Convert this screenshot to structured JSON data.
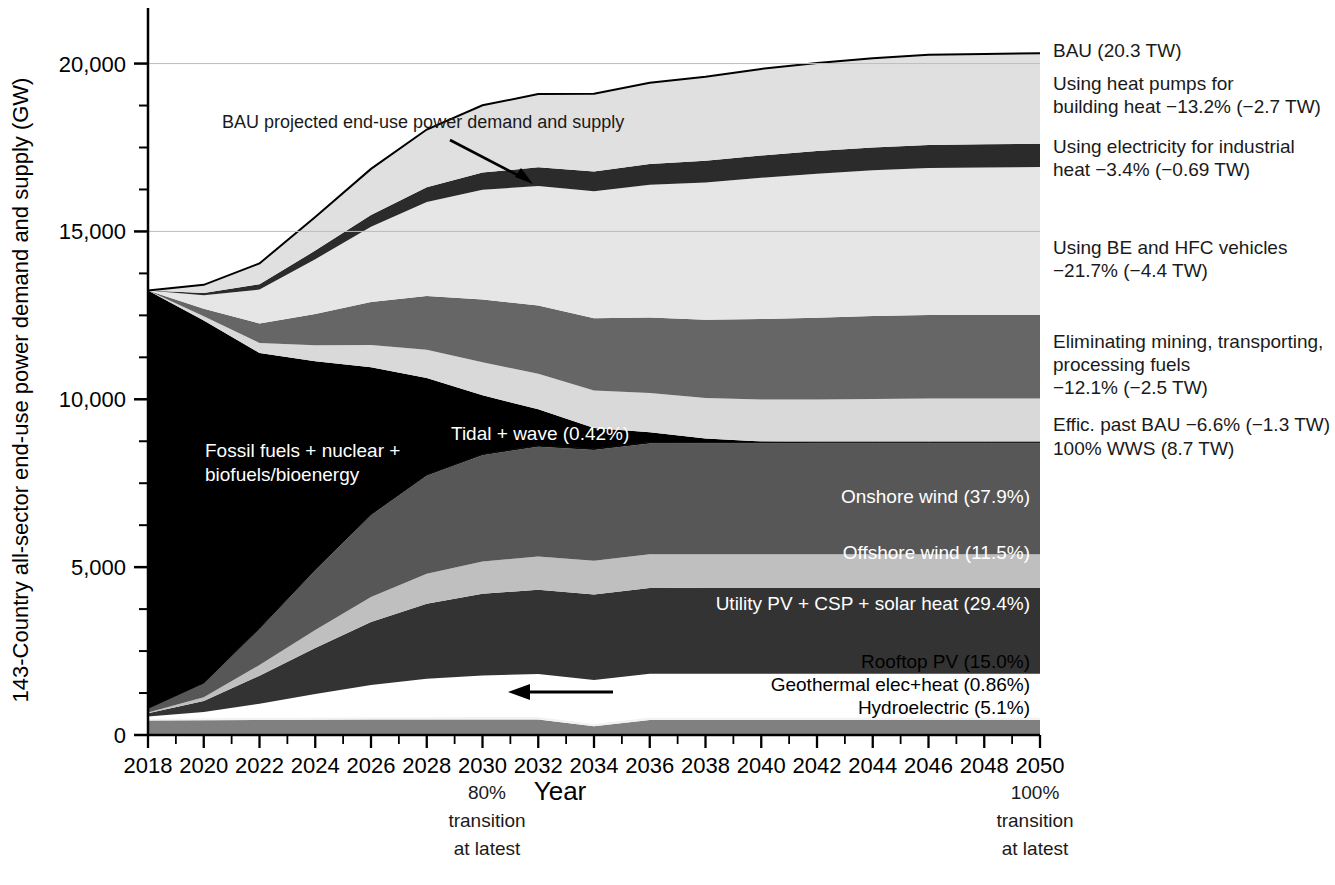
{
  "chart_data": {
    "type": "area",
    "title": "",
    "xlabel": "Year",
    "ylabel": "143-Country all-sector end-use power demand and supply (GW)",
    "xlim": [
      2018,
      2050
    ],
    "ylim": [
      0,
      21000
    ],
    "ytick_values": [
      0,
      5000,
      10000,
      15000,
      20000
    ],
    "ytick_labels": [
      "0",
      "5,000",
      "10,000",
      "15,000",
      "20,000"
    ],
    "xtick_labels": [
      "2018",
      "2020",
      "2022",
      "2024",
      "2026",
      "2028",
      "2030",
      "2032",
      "2034",
      "2036",
      "2038",
      "2040",
      "2042",
      "2044",
      "2046",
      "2048",
      "2050"
    ],
    "grid": "horizontal-faint",
    "legend": "inline-labels",
    "x": [
      2018,
      2020,
      2022,
      2024,
      2026,
      2028,
      2030,
      2032,
      2034,
      2036,
      2038,
      2040,
      2042,
      2044,
      2046,
      2048,
      2050
    ],
    "series": [
      {
        "name": "Hydroelectric",
        "label": "Hydroelectric (5.1%)",
        "color": "#808080",
        "values": [
          430,
          440,
          450,
          455,
          460,
          462,
          463,
          464,
          264,
          444,
          444,
          444,
          444,
          444,
          444,
          444,
          444
        ]
      },
      {
        "name": "Geothermal elec+heat",
        "label": "Geothermal elec+heat (0.86%)",
        "color": "#f2f2f2",
        "values": [
          60,
          62,
          64,
          66,
          68,
          70,
          72,
          73,
          74,
          74,
          75,
          75,
          75,
          75,
          75,
          75,
          75
        ]
      },
      {
        "name": "Rooftop PV",
        "label": "Rooftop PV (15.0%)",
        "color": "#ffffff",
        "values": [
          60,
          180,
          420,
          700,
          960,
          1140,
          1240,
          1280,
          1300,
          1305,
          1305,
          1305,
          1305,
          1305,
          1305,
          1305,
          1305
        ]
      },
      {
        "name": "Utility PV + CSP + solar heat",
        "label": "Utility PV + CSP + solar heat (29.4%)",
        "color": "#333333",
        "values": [
          100,
          330,
          830,
          1370,
          1880,
          2240,
          2430,
          2510,
          2550,
          2558,
          2560,
          2560,
          2560,
          2560,
          2560,
          2560,
          2560
        ]
      },
      {
        "name": "Offshore wind",
        "label": "Offshore wind (11.5%)",
        "color": "#bfbfbf",
        "values": [
          20,
          110,
          320,
          540,
          740,
          890,
          960,
          990,
          1000,
          1001,
          1001,
          1001,
          1001,
          1001,
          1001,
          1001,
          1001
        ]
      },
      {
        "name": "Onshore wind",
        "label": "Onshore wind (37.9%)",
        "color": "#575757",
        "values": [
          120,
          420,
          1080,
          1780,
          2440,
          2920,
          3170,
          3270,
          3300,
          3299,
          3299,
          3299,
          3299,
          3299,
          3299,
          3299,
          3299
        ]
      },
      {
        "name": "Tidal + wave",
        "label": "Tidal + wave (0.42%)",
        "color": "#111111",
        "values": [
          3,
          8,
          14,
          22,
          28,
          33,
          35,
          36,
          37,
          37,
          37,
          37,
          37,
          37,
          37,
          37,
          37
        ]
      },
      {
        "name": "Fossil fuels + nuclear + biofuels/bioenergy",
        "label": "Fossil fuels + nuclear +\nbiofuels/bioenergy",
        "color": "#000000",
        "values": [
          12450,
          10800,
          8200,
          6200,
          4380,
          2880,
          1750,
          1080,
          620,
          300,
          110,
          20,
          0,
          0,
          0,
          0,
          0
        ]
      },
      {
        "name": "Efficiency past BAU",
        "label": "Effic. past BAU −6.6% (−1.3 TW)",
        "color": "#d9d9d9",
        "values": [
          0,
          120,
          300,
          480,
          660,
          840,
          980,
          1060,
          1120,
          1170,
          1210,
          1250,
          1270,
          1290,
          1300,
          1300,
          1300
        ]
      },
      {
        "name": "Eliminating mining, transporting, processing fuels",
        "label": "Eliminating mining, transporting,\nprocessing fuels −12.1% (−2.5 TW)",
        "color": "#666666",
        "values": [
          0,
          230,
          580,
          930,
          1280,
          1600,
          1870,
          2030,
          2150,
          2250,
          2330,
          2400,
          2440,
          2470,
          2490,
          2495,
          2500
        ]
      },
      {
        "name": "Using BE and HFC vehicles",
        "label": "Using BE and HFC vehicles\n−21.7% (−4.4 TW)",
        "color": "#e6e6e6",
        "values": [
          0,
          400,
          1010,
          1630,
          2240,
          2800,
          3270,
          3560,
          3780,
          3950,
          4090,
          4210,
          4290,
          4340,
          4380,
          4390,
          4400
        ]
      },
      {
        "name": "Using electricity for industrial heat",
        "label": "Using electricity for industrial\nheat −3.4% (−0.69 TW)",
        "color": "#2b2b2b",
        "values": [
          0,
          63,
          159,
          256,
          352,
          440,
          513,
          558,
          592,
          620,
          642,
          660,
          672,
          681,
          687,
          689,
          690
        ]
      },
      {
        "name": "Using heat pumps for building heat",
        "label": "Using heat pumps for\nbuilding heat −13.2% (−2.7 TW)",
        "color": "#e0e0e0",
        "values": [
          0,
          246,
          620,
          1000,
          1375,
          1720,
          2005,
          2180,
          2315,
          2420,
          2505,
          2580,
          2625,
          2660,
          2685,
          2693,
          2700
        ]
      }
    ],
    "bau_total": {
      "label": "BAU (20.3 TW)",
      "values": [
        13243,
        13410,
        13950,
        14500,
        15100,
        15700,
        16300,
        16800,
        17300,
        17800,
        18350,
        18900,
        19400,
        19750,
        20050,
        20200,
        20300
      ]
    },
    "wws_total_label": "100% WWS (8.7 TW)",
    "annotations": [
      {
        "name": "bau-annotation",
        "text": "BAU projected end-use power demand and supply"
      },
      {
        "name": "transition-80",
        "text": "80%\ntransition\nat latest",
        "year": 2030
      },
      {
        "name": "transition-100",
        "text": "100%\ntransition\nat latest",
        "year": 2050
      }
    ]
  },
  "axes": {
    "y_title": "143-Country all-sector end-use power demand and supply (GW)",
    "x_title": "Year",
    "y_ticks": [
      "20,000",
      "15,000",
      "10,000",
      "5,000",
      "0"
    ],
    "x_ticks": [
      "2018",
      "2020",
      "2022",
      "2024",
      "2026",
      "2028",
      "2030",
      "2032",
      "2034",
      "2036",
      "2038",
      "2040",
      "2042",
      "2044",
      "2046",
      "2048",
      "2050"
    ]
  },
  "right_labels": [
    {
      "id": "bau",
      "text": "BAU (20.3 TW)"
    },
    {
      "id": "heat-pumps-1",
      "text": "Using heat pumps for"
    },
    {
      "id": "heat-pumps-2",
      "text": "building heat −13.2% (−2.7 TW)"
    },
    {
      "id": "industrial-heat-1",
      "text": "Using electricity for industrial"
    },
    {
      "id": "industrial-heat-2",
      "text": "heat −3.4% (−0.69 TW)"
    },
    {
      "id": "vehicles-1",
      "text": "Using BE and HFC vehicles"
    },
    {
      "id": "vehicles-2",
      "text": "−21.7% (−4.4 TW)"
    },
    {
      "id": "mining-1",
      "text": "Eliminating mining, transporting,"
    },
    {
      "id": "mining-2",
      "text": "processing fuels"
    },
    {
      "id": "mining-3",
      "text": "−12.1% (−2.5 TW)"
    },
    {
      "id": "effic",
      "text": "Effic. past BAU −6.6% (−1.3 TW)"
    },
    {
      "id": "wws",
      "text": "100% WWS (8.7 TW)"
    }
  ],
  "inchart_labels": [
    {
      "id": "bau-annotation",
      "text": "BAU projected end-use power demand and supply"
    },
    {
      "id": "fossil-1",
      "text": "Fossil fuels + nuclear +"
    },
    {
      "id": "fossil-2",
      "text": "biofuels/bioenergy"
    },
    {
      "id": "tidal",
      "text": "Tidal + wave (0.42%)"
    },
    {
      "id": "onshore-wind",
      "text": "Onshore wind (37.9%)"
    },
    {
      "id": "offshore-wind",
      "text": "Offshore wind (11.5%)"
    },
    {
      "id": "utility-pv",
      "text": "Utility PV + CSP + solar heat (29.4%)"
    },
    {
      "id": "rooftop-pv",
      "text": "Rooftop PV (15.0%)"
    },
    {
      "id": "geothermal",
      "text": "Geothermal elec+heat (0.86%)"
    },
    {
      "id": "hydro",
      "text": "Hydroelectric (5.1%)"
    }
  ],
  "bottom_notes": {
    "left": [
      "80%",
      "transition",
      "at latest"
    ],
    "right": [
      "100%",
      "transition",
      "at latest"
    ],
    "axis_title": "Year"
  },
  "colors": {
    "background": "#ffffff",
    "axis": "#000000",
    "grid": "#cccccc"
  }
}
